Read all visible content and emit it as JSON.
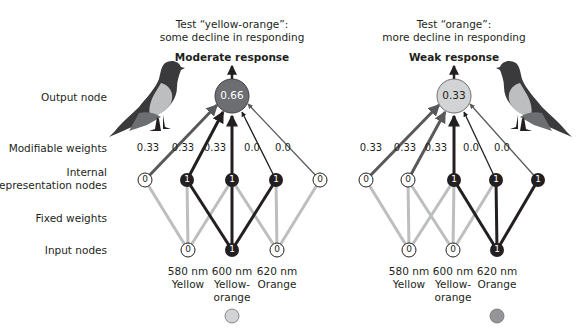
{
  "row_labels": {
    "output": "Output node",
    "modifiable": "Modifiable weights",
    "internal_line1": "Internal",
    "internal_line2": "representation nodes",
    "fixed": "Fixed weights",
    "input": "Input nodes"
  },
  "left_panel": {
    "title_line1": "Test “yellow-orange”:",
    "title_line2": "some decline in responding",
    "response": "Moderate response",
    "output_value": "0.66",
    "output_color": "#6d6e71",
    "weights": [
      "0.33",
      "0.33",
      "0.33",
      "0.0",
      "0.0"
    ],
    "internal_nodes": [
      "0",
      "1",
      "1",
      "1",
      "0"
    ],
    "input_nodes": [
      "0",
      "1",
      "0"
    ],
    "inputs": [
      {
        "wavelength": "580 nm",
        "name_line1": "Yellow",
        "name_line2": ""
      },
      {
        "wavelength": "600 nm",
        "name_line1": "Yellow-",
        "name_line2": "orange"
      },
      {
        "wavelength": "620 nm",
        "name_line1": "Orange",
        "name_line2": ""
      }
    ],
    "swatch_color": "#d1d3d4"
  },
  "right_panel": {
    "title_line1": "Test “orange”:",
    "title_line2": "more decline in responding",
    "response": "Weak response",
    "output_value": "0.33",
    "output_color": "#d1d3d4",
    "weights": [
      "0.33",
      "0.33",
      "0.33",
      "0.0",
      "0.0"
    ],
    "internal_nodes": [
      "0",
      "0",
      "1",
      "1",
      "1"
    ],
    "input_nodes": [
      "0",
      "0",
      "1"
    ],
    "inputs": [
      {
        "wavelength": "580 nm",
        "name_line1": "Yellow",
        "name_line2": ""
      },
      {
        "wavelength": "600 nm",
        "name_line1": "Yellow-",
        "name_line2": "orange"
      },
      {
        "wavelength": "620 nm",
        "name_line1": "Orange",
        "name_line2": ""
      }
    ],
    "swatch_color": "#939598"
  }
}
